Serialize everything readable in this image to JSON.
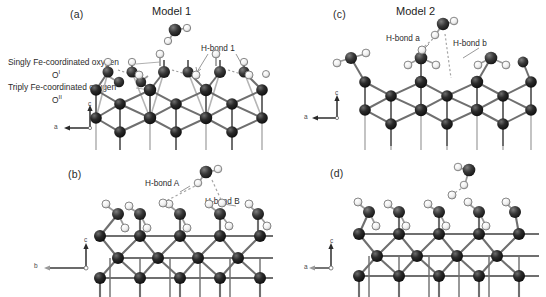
{
  "figure": {
    "width": 546,
    "height": 297,
    "background": "#ffffff",
    "caption_style": "four-panel crystal surface model figure"
  },
  "colors": {
    "iron_atom": "#1f1f1f",
    "oxygen_atom": "#3a3a3a",
    "hydrogen_atom": "#f2f2f2",
    "hydrogen_stroke": "#6e6e6e",
    "bond": "#7d7d7d",
    "bond_dark": "#4a4a4a",
    "hbond_dashed": "#9a9a9a",
    "text": "#2b2b2b",
    "axis": "#555555"
  },
  "panels": [
    {
      "id": "a",
      "label": "(a)",
      "title": "Model 1",
      "annotations": [
        {
          "name": "hbond-1",
          "text": "H-bond 1"
        },
        {
          "name": "singly-coordinated-oxygen",
          "text": "Singly Fe-coordinated oxygen",
          "symbol": "O",
          "superscript": "I"
        },
        {
          "name": "triply-coordinated-oxygen",
          "text": "Triply Fe-coordinated oxygen",
          "symbol": "O",
          "superscript": "II"
        }
      ],
      "axes": {
        "vertical": "c",
        "horizontal": "a"
      }
    },
    {
      "id": "c",
      "label": "(c)",
      "title": "Model 2",
      "annotations": [
        {
          "name": "hbond-a",
          "text": "H-bond a"
        },
        {
          "name": "hbond-b",
          "text": "H-bond b"
        }
      ],
      "axes": {
        "vertical": "c",
        "horizontal": "a"
      }
    },
    {
      "id": "b",
      "label": "(b)",
      "title": "",
      "annotations": [
        {
          "name": "hbond-A",
          "text": "H-bond A"
        },
        {
          "name": "hbond-B",
          "text": "H-bond B"
        }
      ],
      "axes": {
        "vertical": "c",
        "horizontal": "b"
      }
    },
    {
      "id": "d",
      "label": "(d)",
      "title": "",
      "annotations": [],
      "axes": {
        "vertical": "c",
        "horizontal": "a"
      }
    }
  ],
  "legend_text": {
    "singly_line1": "Singly Fe-coordinated oxygen",
    "singly_line2_symbol": "O",
    "singly_line2_sup": "I",
    "triply_line1": "Triply Fe-coordinated oxygen",
    "triply_line2_symbol": "O",
    "triply_line2_sup": "II"
  }
}
